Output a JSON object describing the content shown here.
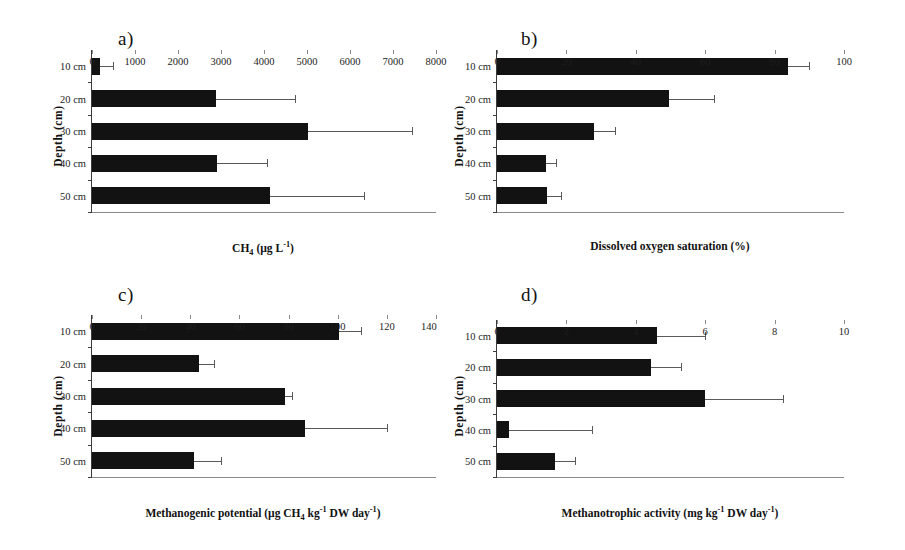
{
  "figure": {
    "background": "#ffffff",
    "bar_color": "#121212",
    "error_color": "#5a5a5a",
    "axis_color": "#3b3b3b"
  },
  "panels": {
    "a": {
      "label": "a)",
      "y_axis_title": "Depth (cm)",
      "x_axis_title_html": "CH<sub>4</sub> (µg L<sup>-1</sup>)",
      "x_axis_title_text": "CH4 (µg L-1)",
      "categories": [
        "10 cm",
        "20 cm",
        "30 cm",
        "40 cm",
        "50 cm"
      ],
      "xticks": [
        "0",
        "1000",
        "2000",
        "3000",
        "4000",
        "5000",
        "6000",
        "7000",
        "8000"
      ]
    },
    "b": {
      "label": "b)",
      "y_axis_title": "Depth (cm)",
      "x_axis_title_html": "Dissolved oxygen saturation (%)",
      "x_axis_title_text": "Dissolved oxygen saturation (%)",
      "categories": [
        "10 cm",
        "20 cm",
        "30 cm",
        "40 cm",
        "50 cm"
      ],
      "xticks": [
        "0",
        "20",
        "40",
        "60",
        "80",
        "100"
      ]
    },
    "c": {
      "label": "c)",
      "y_axis_title": "Depth (cm)",
      "x_axis_title_html": "Methanogenic potential (µg CH<sub>4</sub> kg<sup>-1</sup> DW day<sup>-1</sup>)",
      "x_axis_title_text": "Methanogenic potential (µg CH4 kg-1 DW day-1)",
      "categories": [
        "10 cm",
        "20 cm",
        "30 cm",
        "40 cm",
        "50 cm"
      ],
      "xticks": [
        "0",
        "20",
        "40",
        "60",
        "80",
        "100",
        "120",
        "140"
      ]
    },
    "d": {
      "label": "d)",
      "y_axis_title": "Depth (cm)",
      "x_axis_title_html": "Methanotrophic activity (mg kg<sup>-1</sup> DW day<sup>-1</sup>)",
      "x_axis_title_text": "Methanotrophic activity (mg kg-1 DW day-1)",
      "categories": [
        "10 cm",
        "20 cm",
        "30 cm",
        "40 cm",
        "50 cm"
      ],
      "xticks": [
        "0",
        "2",
        "4",
        "6",
        "8",
        "10"
      ]
    }
  },
  "chart_data": [
    {
      "panel": "a",
      "type": "bar",
      "orientation": "horizontal",
      "title": "a)",
      "xlabel": "CH4 (µg L-1)",
      "ylabel": "Depth (cm)",
      "categories": [
        "10 cm",
        "20 cm",
        "30 cm",
        "40 cm",
        "50 cm"
      ],
      "values": [
        180,
        2880,
        5030,
        2900,
        4150
      ],
      "errors_upper": [
        480,
        4720,
        7450,
        4080,
        6320
      ],
      "xlim": [
        0,
        8000
      ],
      "xticks": [
        0,
        1000,
        2000,
        3000,
        4000,
        5000,
        6000,
        7000,
        8000
      ],
      "grid": false,
      "legend": "none"
    },
    {
      "panel": "b",
      "type": "bar",
      "orientation": "horizontal",
      "title": "b)",
      "xlabel": "Dissolved oxygen saturation (%)",
      "ylabel": "Depth (cm)",
      "categories": [
        "10 cm",
        "20 cm",
        "30 cm",
        "40 cm",
        "50 cm"
      ],
      "values": [
        84,
        49.5,
        28,
        14,
        14.5
      ],
      "errors_upper": [
        90,
        62.5,
        34,
        17,
        18.5
      ],
      "xlim": [
        0,
        100
      ],
      "xticks": [
        0,
        20,
        40,
        60,
        80,
        100
      ],
      "grid": false,
      "legend": "none"
    },
    {
      "panel": "c",
      "type": "bar",
      "orientation": "horizontal",
      "title": "c)",
      "xlabel": "Methanogenic potential (µg CH4 kg-1 DW day-1)",
      "ylabel": "Depth (cm)",
      "categories": [
        "10 cm",
        "20 cm",
        "30 cm",
        "40 cm",
        "50 cm"
      ],
      "values": [
        100.5,
        43.5,
        78.5,
        86.5,
        41.5
      ],
      "errors_upper": [
        109.5,
        49.5,
        81.5,
        120,
        52.5
      ],
      "xlim": [
        0,
        140
      ],
      "xticks": [
        0,
        20,
        40,
        60,
        80,
        100,
        120,
        140
      ],
      "grid": false,
      "legend": "none"
    },
    {
      "panel": "d",
      "type": "bar",
      "orientation": "horizontal",
      "title": "d)",
      "xlabel": "Methanotrophic activity (mg kg-1 DW day-1)",
      "ylabel": "Depth (cm)",
      "categories": [
        "10 cm",
        "20 cm",
        "30 cm",
        "40 cm",
        "50 cm"
      ],
      "values": [
        4.6,
        4.45,
        6.0,
        0.35,
        1.68
      ],
      "errors_upper": [
        6.0,
        5.3,
        8.25,
        2.75,
        2.25
      ],
      "xlim": [
        0,
        10
      ],
      "xticks": [
        0,
        2,
        4,
        6,
        8,
        10
      ],
      "grid": false,
      "legend": "none"
    }
  ]
}
